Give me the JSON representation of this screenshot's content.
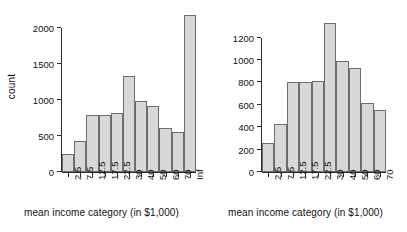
{
  "figure": {
    "background": "#ffffff",
    "bar_fill": "#d8d8d8",
    "bar_border": "#6e6e6e",
    "axis_color": "#2b2b2b"
  },
  "chart_data": [
    {
      "type": "bar",
      "title": "",
      "xlabel": "mean income category (in $1,000)",
      "ylabel": "count",
      "categories": [
        "2.5",
        "7.5",
        "12.5",
        "17.5",
        "22.5",
        "30",
        "40",
        "50",
        "60",
        "70",
        "Inf"
      ],
      "values": [
        250,
        425,
        800,
        800,
        815,
        1330,
        995,
        925,
        615,
        555,
        2180
      ],
      "ylim": [
        0,
        2200
      ],
      "yticks": [
        0,
        500,
        1000,
        1500,
        2000
      ],
      "ytick_labels": [
        "0",
        "500",
        "1000",
        "1500",
        "2000"
      ],
      "grid": false,
      "legend": "none"
    },
    {
      "type": "bar",
      "title": "",
      "xlabel": "mean income category (in $1,000)",
      "ylabel": "",
      "categories": [
        "2.5",
        "7.5",
        "12.5",
        "17.5",
        "22.5",
        "30",
        "40",
        "50",
        "60",
        "70"
      ],
      "values": [
        255,
        425,
        800,
        800,
        815,
        1330,
        995,
        925,
        615,
        555
      ],
      "ylim": [
        0,
        1340
      ],
      "yticks": [
        0,
        200,
        400,
        600,
        800,
        1000,
        1200
      ],
      "ytick_labels": [
        "0",
        "200",
        "400",
        "600",
        "800",
        "1000",
        "1200"
      ],
      "grid": false,
      "legend": "none"
    }
  ]
}
